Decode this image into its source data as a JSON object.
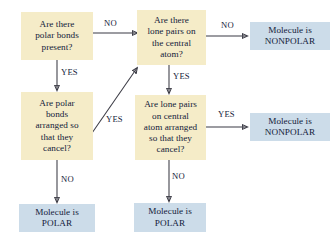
{
  "diagram": {
    "colors": {
      "decision_fill": "#f5ecc8",
      "terminal_fill": "#ccdce9",
      "text": "#13213a",
      "arrow": "#3a3a44",
      "background": "#ffffff"
    },
    "nodes": [
      {
        "id": "polar-bonds-present",
        "kind": "decision",
        "text": "Are there\npolar bonds\npresent?"
      },
      {
        "id": "lone-pairs-central-atom",
        "kind": "decision",
        "text": "Are there\nlone pairs on\nthe central\natom?"
      },
      {
        "id": "nonpolar-top",
        "kind": "terminal",
        "text": "Molecule is\nNONPOLAR"
      },
      {
        "id": "polar-bonds-cancel",
        "kind": "decision",
        "text": "Are polar\nbonds\narranged so\nthat they\ncancel?"
      },
      {
        "id": "lone-pairs-cancel",
        "kind": "decision",
        "text": "Are lone pairs\non central\natom arranged\nso that they\ncancel?"
      },
      {
        "id": "nonpolar-middle",
        "kind": "terminal",
        "text": "Molecule is\nNONPOLAR"
      },
      {
        "id": "polar-bottom-left",
        "kind": "terminal",
        "text": "Molecule is\nPOLAR"
      },
      {
        "id": "polar-bottom-middle",
        "kind": "terminal",
        "text": "Molecule is\nPOLAR"
      }
    ],
    "edge_labels": [
      {
        "id": "no-polar-bonds-to-lone-pairs",
        "text": "NO"
      },
      {
        "id": "yes-polar-bonds-to-cancel",
        "text": "YES"
      },
      {
        "id": "no-lone-pairs-to-nonpolar-top",
        "text": "NO"
      },
      {
        "id": "yes-lone-pairs-to-cancel",
        "text": "YES"
      },
      {
        "id": "yes-bonds-cancel-to-lone-pairs",
        "text": "YES"
      },
      {
        "id": "no-bonds-cancel-to-polar",
        "text": "NO"
      },
      {
        "id": "yes-lone-cancel-to-nonpolar",
        "text": "YES"
      },
      {
        "id": "no-lone-cancel-to-polar",
        "text": "NO"
      }
    ]
  }
}
